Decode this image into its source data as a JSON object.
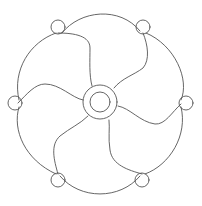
{
  "figure": {
    "width": 202,
    "height": 206,
    "background": "#ffffff",
    "stroke_color": "#555555",
    "hub": {
      "cx": 100,
      "cy": 102,
      "outer_r": 17,
      "inner_r": 10
    },
    "small_circles": [
      {
        "name": "top-left",
        "cx": 58,
        "cy": 27,
        "r": 7
      },
      {
        "name": "top-right",
        "cx": 143,
        "cy": 27,
        "r": 7
      },
      {
        "name": "right",
        "cx": 186,
        "cy": 103,
        "r": 7
      },
      {
        "name": "bottom-right",
        "cx": 142,
        "cy": 180,
        "r": 7
      },
      {
        "name": "bottom-left",
        "cx": 58,
        "cy": 180,
        "r": 7
      },
      {
        "name": "left",
        "cx": 15,
        "cy": 103,
        "r": 7
      }
    ],
    "outer_arcs": [
      {
        "name": "top",
        "d": "M62,33 C80,10 120,6 140,31"
      },
      {
        "name": "upper-right",
        "d": "M146,33 C175,45 190,80 181,100"
      },
      {
        "name": "lower-right",
        "d": "M181,107 C188,135 170,165 145,174"
      },
      {
        "name": "bottom",
        "d": "M140,176 C120,200 80,200 60,176"
      },
      {
        "name": "lower-left",
        "d": "M56,174 C25,160 12,130 19,107"
      },
      {
        "name": "upper-left",
        "d": "M19,100 C12,70 30,42 56,33"
      }
    ],
    "blade_edges": [
      {
        "name": "edge-top-left",
        "d": "M58,33 C75,33 90,36 90,48 C90,60 89,75 92,86"
      },
      {
        "name": "edge-top-right",
        "d": "M143,33 C148,45 150,60 143,68 C134,75 122,78 114,88"
      },
      {
        "name": "edge-right",
        "d": "M181,104 C172,112 165,125 155,124 C140,122 130,108 118,106"
      },
      {
        "name": "edge-bottom-right",
        "d": "M142,174 C128,170 112,165 110,150 C108,138 110,128 109,120"
      },
      {
        "name": "edge-bottom-left",
        "d": "M58,174 C54,160 50,145 60,136 C70,128 80,124 88,116"
      },
      {
        "name": "edge-left",
        "d": "M18,103 C27,94 35,84 45,84 C60,84 72,98 83,100"
      }
    ]
  }
}
